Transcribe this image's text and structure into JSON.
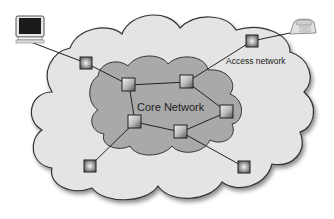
{
  "diagram": {
    "type": "network-topology",
    "labels": {
      "core": "Core Network",
      "access": "Access network"
    },
    "colors": {
      "background": "#ffffff",
      "access_cloud_fill": "#e4e4e4",
      "core_cloud_fill": "#a9a9a9",
      "outline": "#333333",
      "link": "#222222",
      "node_fill_light": "#f2f2f2",
      "node_fill_dark": "#6a6a6a"
    },
    "endpoints": [
      {
        "id": "computer",
        "icon": "computer-icon",
        "x": 30,
        "y": 30
      },
      {
        "id": "telephone",
        "icon": "telephone-icon",
        "x": 300,
        "y": 28
      }
    ],
    "nodes": [
      {
        "id": "access-nw",
        "zone": "access",
        "x": 86,
        "y": 63
      },
      {
        "id": "access-ne",
        "zone": "access",
        "x": 252,
        "y": 41
      },
      {
        "id": "access-sw",
        "zone": "access",
        "x": 90,
        "y": 166
      },
      {
        "id": "access-se",
        "zone": "access",
        "x": 244,
        "y": 167
      },
      {
        "id": "core-a",
        "zone": "core",
        "x": 129,
        "y": 85
      },
      {
        "id": "core-b",
        "zone": "core",
        "x": 187,
        "y": 82
      },
      {
        "id": "core-c",
        "zone": "core",
        "x": 227,
        "y": 112
      },
      {
        "id": "core-d",
        "zone": "core",
        "x": 181,
        "y": 132
      },
      {
        "id": "core-e",
        "zone": "core",
        "x": 135,
        "y": 122
      }
    ],
    "links": [
      [
        "computer",
        "access-nw"
      ],
      [
        "access-nw",
        "core-a"
      ],
      [
        "core-a",
        "core-b"
      ],
      [
        "core-a",
        "core-e"
      ],
      [
        "core-b",
        "core-c"
      ],
      [
        "core-b",
        "access-ne"
      ],
      [
        "access-ne",
        "telephone"
      ],
      [
        "core-c",
        "core-d"
      ],
      [
        "core-d",
        "core-e"
      ],
      [
        "core-e",
        "access-sw"
      ],
      [
        "core-d",
        "access-se"
      ]
    ]
  }
}
